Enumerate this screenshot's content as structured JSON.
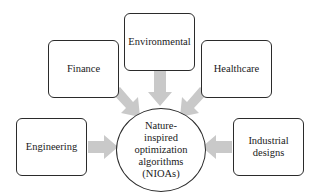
{
  "diagram": {
    "type": "hub-and-spoke",
    "center": {
      "label": "Nature-\ninspired\noptimization\nalgorithms\n(NIOAs)"
    },
    "nodes": [
      {
        "id": "finance",
        "label": "Finance"
      },
      {
        "id": "environmental",
        "label": "Environmental"
      },
      {
        "id": "healthcare",
        "label": "Healthcare"
      },
      {
        "id": "engineering",
        "label": "Engineering"
      },
      {
        "id": "industrial",
        "label": "Industrial\ndesigns"
      }
    ],
    "edges": [
      {
        "from": "finance",
        "to": "center"
      },
      {
        "from": "environmental",
        "to": "center"
      },
      {
        "from": "healthcare",
        "to": "center"
      },
      {
        "from": "engineering",
        "to": "center"
      },
      {
        "from": "industrial",
        "to": "center"
      }
    ],
    "colors": {
      "arrow": "#c9c9c9",
      "border": "#2b2b2b",
      "background": "#ffffff"
    }
  }
}
